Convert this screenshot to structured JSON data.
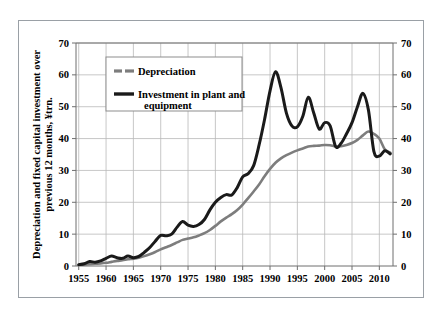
{
  "figure": {
    "frame_visible": true,
    "background_color": "#ffffff",
    "border_color": "#9aa0a6"
  },
  "chart_data": {
    "type": "line",
    "title": "",
    "subtitle": "",
    "xlabel": "",
    "ylabel": "Depreciation and fixed capital investment over previous 12 months, ¥trn.",
    "ylabel_line1": "Depreciation and fixed capital investment over",
    "ylabel_line2": "previous 12 months, ¥trn.",
    "xlim": [
      1954.5,
      2012.5
    ],
    "ylim": [
      0,
      70
    ],
    "yticks": [
      0,
      10,
      20,
      30,
      40,
      50,
      60,
      70
    ],
    "ytick_labels": [
      "0",
      "10",
      "20",
      "30",
      "40",
      "50",
      "60",
      "70"
    ],
    "xticks": [
      1955,
      1960,
      1965,
      1970,
      1975,
      1980,
      1985,
      1990,
      1995,
      2000,
      2005,
      2010
    ],
    "xtick_labels": [
      "1955",
      "1960",
      "1965",
      "1970",
      "1975",
      "1980",
      "1985",
      "1990",
      "1995",
      "2000",
      "2005",
      "2010"
    ],
    "right_axis": true,
    "right_yticks": [
      0,
      10,
      20,
      30,
      40,
      50,
      60,
      70
    ],
    "right_ytick_labels": [
      "0",
      "10",
      "20",
      "30",
      "40",
      "50",
      "60",
      "70"
    ],
    "grid": true,
    "grid_color": "#b9b9b9",
    "legend_position": "upper-left-inside",
    "series": [
      {
        "name": "Depreciation",
        "color": "#7d7d7d",
        "linewidth": 2.6,
        "x": [
          1955,
          1956,
          1957,
          1958,
          1959,
          1960,
          1961,
          1962,
          1963,
          1964,
          1965,
          1966,
          1967,
          1968,
          1969,
          1970,
          1971,
          1972,
          1973,
          1974,
          1975,
          1976,
          1977,
          1978,
          1979,
          1980,
          1981,
          1982,
          1983,
          1984,
          1985,
          1986,
          1987,
          1988,
          1989,
          1990,
          1991,
          1992,
          1993,
          1994,
          1995,
          1996,
          1997,
          1998,
          1999,
          2000,
          2001,
          2002,
          2003,
          2004,
          2005,
          2006,
          2007,
          2008,
          2009,
          2010,
          2011,
          2012
        ],
        "values": [
          0.3,
          0.4,
          0.6,
          0.7,
          0.8,
          1.0,
          1.3,
          1.6,
          1.8,
          2.1,
          2.3,
          2.6,
          3.1,
          3.7,
          4.4,
          5.2,
          5.9,
          6.6,
          7.4,
          8.2,
          8.6,
          9.0,
          9.6,
          10.3,
          11.3,
          12.6,
          14.0,
          15.2,
          16.3,
          17.6,
          19.3,
          21.3,
          23.4,
          25.6,
          28.2,
          30.5,
          32.4,
          33.8,
          34.8,
          35.6,
          36.3,
          36.9,
          37.5,
          37.7,
          37.8,
          38.0,
          37.9,
          37.5,
          37.6,
          38.0,
          38.6,
          39.6,
          41.0,
          42.2,
          41.5,
          40.0,
          36.6,
          35.6
        ]
      },
      {
        "name": "Investment in plant and equipment",
        "color": "#1a1a1a",
        "linewidth": 3.0,
        "x": [
          1955,
          1956,
          1957,
          1958,
          1959,
          1960,
          1961,
          1962,
          1963,
          1964,
          1965,
          1966,
          1967,
          1968,
          1969,
          1970,
          1971,
          1972,
          1973,
          1974,
          1975,
          1976,
          1977,
          1978,
          1979,
          1980,
          1981,
          1982,
          1983,
          1984,
          1985,
          1986,
          1987,
          1988,
          1989,
          1990,
          1991,
          1992,
          1993,
          1994,
          1995,
          1996,
          1997,
          1998,
          1999,
          2000,
          2001,
          2002,
          2003,
          2004,
          2005,
          2006,
          2007,
          2008,
          2009,
          2010,
          2011,
          2012
        ],
        "values": [
          0.4,
          0.7,
          1.4,
          1.2,
          1.6,
          2.4,
          3.1,
          2.6,
          2.4,
          3.1,
          2.6,
          3.0,
          4.3,
          5.8,
          7.8,
          9.6,
          9.5,
          10.0,
          12.2,
          14.0,
          12.8,
          12.4,
          13.0,
          14.6,
          17.6,
          20.0,
          21.5,
          22.4,
          22.3,
          24.6,
          28.0,
          29.0,
          31.5,
          38.0,
          46.0,
          55.0,
          61.0,
          56.0,
          48.0,
          44.0,
          43.7,
          47.0,
          53.0,
          48.0,
          43.0,
          45.0,
          44.0,
          37.5,
          38.5,
          41.5,
          45.0,
          50.0,
          54.2,
          49.0,
          36.0,
          34.5,
          36.2,
          35.2
        ]
      }
    ],
    "annotations": []
  },
  "legend": {
    "entries": [
      {
        "label": "Depreciation",
        "swatch": "gray-dashed-line",
        "color": "#7d7d7d"
      },
      {
        "label": "Investment in plant and equipment",
        "label_line1": "Investment in plant and",
        "label_line2": "equipment",
        "swatch": "black-solid-line",
        "color": "#1a1a1a"
      }
    ]
  }
}
